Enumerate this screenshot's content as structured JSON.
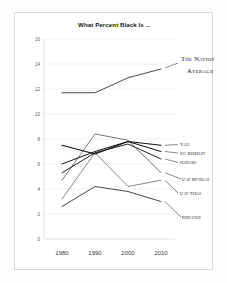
{
  "figure": {
    "title": "What Percent Black Is ...",
    "background_color": "#ffffff",
    "frame_color": "#d9d9d9"
  },
  "chart_data": {
    "type": "line",
    "title": "What Percent Black Is ...",
    "xlabel": "",
    "ylabel": "",
    "x": [
      1980,
      1990,
      2000,
      2010
    ],
    "xtick_labels": [
      "1980",
      "1990",
      "2000",
      "2010"
    ],
    "ytick_labels": [
      "0",
      "2",
      "4",
      "6",
      "8",
      "10",
      "12",
      "14",
      "16"
    ],
    "yticks": [
      0,
      2,
      4,
      6,
      8,
      10,
      12,
      14,
      16
    ],
    "ylim": [
      0,
      16
    ],
    "xlim": [
      1975,
      2015
    ],
    "grid": true,
    "legend_position": "right-inline-labels",
    "series": [
      {
        "name": "The National Average",
        "values": [
          11.7,
          11.7,
          12.9,
          13.6
        ],
        "color": "#4a4a4a",
        "width": 1.0
      },
      {
        "name": "Yale",
        "values": [
          7.5,
          6.8,
          7.8,
          7.5
        ],
        "color": "#111111",
        "width": 1.2
      },
      {
        "name": "UC Berkeley",
        "values": [
          6.0,
          7.0,
          7.8,
          7.0
        ],
        "color": "#111111",
        "width": 1.0
      },
      {
        "name": "Harvard",
        "values": [
          5.3,
          6.9,
          7.6,
          6.4
        ],
        "color": "#222222",
        "width": 1.0
      },
      {
        "name": "U of Michigan",
        "values": [
          4.7,
          8.4,
          7.9,
          5.3
        ],
        "color": "#6a6a6a",
        "width": 0.9
      },
      {
        "name": "U of Texas",
        "values": [
          3.2,
          6.9,
          4.2,
          4.7
        ],
        "color": "#7a7a7a",
        "width": 0.9
      },
      {
        "name": "Princeton",
        "values": [
          2.6,
          4.2,
          3.8,
          3.0
        ],
        "color": "#333333",
        "width": 0.9
      }
    ],
    "annotations": [
      {
        "text": "The National Average",
        "series": "The National Average"
      },
      {
        "text": "Yale",
        "series": "Yale"
      },
      {
        "text": "UC Berkeley",
        "series": "UC Berkeley"
      },
      {
        "text": "Harvard",
        "series": "Harvard"
      },
      {
        "text": "U of Michigan",
        "series": "U of Michigan"
      },
      {
        "text": "U of Texas",
        "series": "U of Texas"
      },
      {
        "text": "Princeton",
        "series": "Princeton"
      }
    ]
  }
}
